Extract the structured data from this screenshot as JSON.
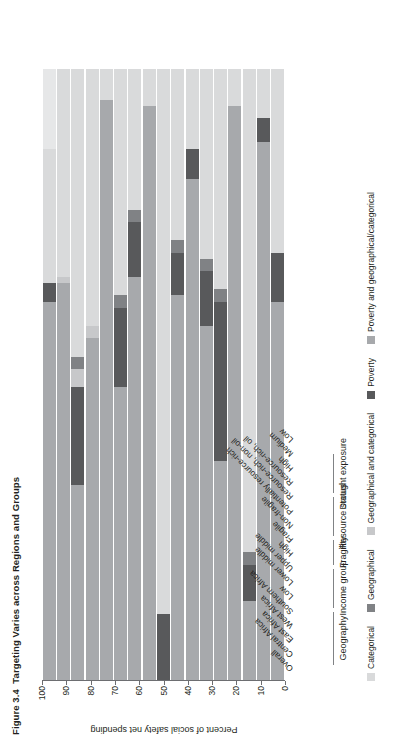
{
  "figure": {
    "number": "Figure 3.4",
    "title": "Targeting Varies across Regions and Groups"
  },
  "axis": {
    "title": "Percent of social safety net spending",
    "ticks": [
      "0",
      "10",
      "20",
      "30",
      "40",
      "50",
      "60",
      "70",
      "80",
      "90",
      "100"
    ],
    "min": 0,
    "max": 100
  },
  "legend": {
    "items": [
      {
        "label": "Categorical",
        "color": "#d9dadb"
      },
      {
        "label": "Geographical",
        "color": "#808285"
      },
      {
        "label": "Geographical and categorical",
        "color": "#c7c8ca"
      },
      {
        "label": "Poverty",
        "color": "#58595b"
      },
      {
        "label": "Poverty and geographical/categorical",
        "color": "#a7a9ac"
      }
    ]
  },
  "groups": [
    {
      "name": "Geography",
      "start": 1,
      "end": 4
    },
    {
      "name": "Income group",
      "start": 5,
      "end": 7
    },
    {
      "name": "Fragility",
      "start": 8,
      "end": 9
    },
    {
      "name": "Resource status",
      "start": 10,
      "end": 12
    },
    {
      "name": "Drought exposure",
      "start": 13,
      "end": 15
    }
  ],
  "chart_data": {
    "type": "bar",
    "orientation": "vertical-stacked",
    "title": "Targeting Varies across Regions and Groups",
    "xlabel": "",
    "ylabel": "Percent of social safety net spending",
    "ylim": [
      0,
      100
    ],
    "grid": false,
    "legend_position": "bottom",
    "series": [
      {
        "name": "Categorical",
        "color": "#d9dadb",
        "values": [
          22,
          19,
          35,
          32,
          47,
          46,
          11,
          89,
          24,
          48,
          31,
          5,
          85,
          58,
          1,
          23,
          23
        ]
      },
      {
        "name": "Geographical",
        "color": "#808285",
        "values": [
          0,
          0,
          0,
          0,
          0,
          0,
          0,
          0,
          0,
          0,
          0,
          0,
          0,
          0,
          0,
          0,
          0
        ]
      },
      {
        "name": "Geographical and categorical",
        "color": "#c7c8ca",
        "values": [
          0,
          0,
          0,
          0,
          0,
          0,
          0,
          0,
          0,
          0,
          0,
          0,
          0,
          0,
          0,
          0,
          0
        ]
      },
      {
        "name": "Poverty",
        "color": "#58595b",
        "values": [
          0,
          0,
          0,
          0,
          0,
          0,
          0,
          0,
          0,
          0,
          0,
          0,
          0,
          0,
          0,
          0,
          0
        ]
      },
      {
        "name": "Poverty and geographical/categorical",
        "color": "#a7a9ac",
        "values": [
          0,
          0,
          0,
          0,
          0,
          0,
          0,
          0,
          0,
          0,
          0,
          0,
          0,
          0,
          0,
          0,
          0
        ]
      }
    ],
    "categories": [
      "Overall",
      "Central Africa",
      "East Africa",
      "West Africa",
      "Southern Africa",
      "Low",
      "Lower middle",
      "Upper middle",
      "High",
      "Fragile",
      "Non-fragile",
      "Potentially resource-rich",
      "Resource-rich, non-oil",
      "Resource-rich, oil",
      "High",
      "Medium",
      "Low"
    ],
    "bars": [
      {
        "category": "Overall",
        "group": "",
        "segments": [
          {
            "series": "Poverty and geographical/categorical",
            "value": 62,
            "color": "#a7a9ac"
          },
          {
            "series": "Poverty",
            "value": 3,
            "color": "#58595b"
          },
          {
            "series": "Categorical",
            "value": 22,
            "color": "#d9dadb"
          },
          {
            "series": "Geographical",
            "value": 13,
            "color": "#e6e7e8"
          }
        ]
      },
      {
        "category": "Central Africa",
        "group": "Geography",
        "segments": [
          {
            "series": "Poverty and geographical/categorical",
            "value": 65,
            "color": "#a7a9ac"
          },
          {
            "series": "Geographical",
            "value": 1,
            "color": "#c7c8ca"
          },
          {
            "series": "Categorical",
            "value": 34,
            "color": "#d9dadb"
          }
        ]
      },
      {
        "category": "East Africa",
        "group": "Geography",
        "segments": [
          {
            "series": "Poverty and geographical/categorical",
            "value": 32,
            "color": "#a7a9ac"
          },
          {
            "series": "Poverty",
            "value": 16,
            "color": "#58595b"
          },
          {
            "series": "Geographical and categorical",
            "value": 3,
            "color": "#c7c8ca"
          },
          {
            "series": "Geographical",
            "value": 2,
            "color": "#808285"
          },
          {
            "series": "Categorical",
            "value": 47,
            "color": "#d9dadb"
          }
        ]
      },
      {
        "category": "West Africa",
        "group": "Geography",
        "segments": [
          {
            "series": "Poverty and geographical/categorical",
            "value": 56,
            "color": "#a7a9ac"
          },
          {
            "series": "Geographical",
            "value": 2,
            "color": "#c7c8ca"
          },
          {
            "series": "Categorical",
            "value": 42,
            "color": "#d9dadb"
          }
        ]
      },
      {
        "category": "Southern Africa",
        "group": "Geography",
        "segments": [
          {
            "series": "Poverty and geographical/categorical",
            "value": 95,
            "color": "#a7a9ac"
          },
          {
            "series": "Categorical",
            "value": 5,
            "color": "#d9dadb"
          }
        ]
      },
      {
        "category": "Low",
        "group": "Income group",
        "segments": [
          {
            "series": "Poverty and geographical/categorical",
            "value": 48,
            "color": "#a7a9ac"
          },
          {
            "series": "Poverty",
            "value": 13,
            "color": "#58595b"
          },
          {
            "series": "Geographical",
            "value": 2,
            "color": "#808285"
          },
          {
            "series": "Categorical",
            "value": 37,
            "color": "#d9dadb"
          }
        ]
      },
      {
        "category": "Lower middle",
        "group": "Income group",
        "segments": [
          {
            "series": "Poverty and geographical/categorical",
            "value": 66,
            "color": "#a7a9ac"
          },
          {
            "series": "Poverty",
            "value": 9,
            "color": "#58595b"
          },
          {
            "series": "Geographical",
            "value": 2,
            "color": "#808285"
          },
          {
            "series": "Categorical",
            "value": 23,
            "color": "#d9dadb"
          }
        ]
      },
      {
        "category": "Upper middle",
        "group": "Income group",
        "segments": [
          {
            "series": "Poverty and geographical/categorical",
            "value": 94,
            "color": "#a7a9ac"
          },
          {
            "series": "Categorical",
            "value": 6,
            "color": "#d9dadb"
          }
        ]
      },
      {
        "category": "High",
        "group": "Income group",
        "segments": [
          {
            "series": "Poverty",
            "value": 11,
            "color": "#58595b"
          },
          {
            "series": "Categorical",
            "value": 89,
            "color": "#d9dadb"
          }
        ]
      },
      {
        "category": "Fragile",
        "group": "Fragility",
        "segments": [
          {
            "series": "Poverty and geographical/categorical",
            "value": 63,
            "color": "#a7a9ac"
          },
          {
            "series": "Poverty",
            "value": 7,
            "color": "#58595b"
          },
          {
            "series": "Geographical",
            "value": 2,
            "color": "#808285"
          },
          {
            "series": "Categorical",
            "value": 28,
            "color": "#d9dadb"
          }
        ]
      },
      {
        "category": "Non-fragile",
        "group": "Fragility",
        "segments": [
          {
            "series": "Poverty and geographical/categorical",
            "value": 82,
            "color": "#a7a9ac"
          },
          {
            "series": "Poverty",
            "value": 5,
            "color": "#58595b"
          },
          {
            "series": "Categorical",
            "value": 13,
            "color": "#d9dadb"
          }
        ]
      },
      {
        "category": "Potentially resource-rich",
        "group": "Resource status",
        "segments": [
          {
            "series": "Poverty and geographical/categorical",
            "value": 58,
            "color": "#a7a9ac"
          },
          {
            "series": "Poverty",
            "value": 9,
            "color": "#58595b"
          },
          {
            "series": "Geographical",
            "value": 2,
            "color": "#808285"
          },
          {
            "series": "Categorical",
            "value": 31,
            "color": "#d9dadb"
          }
        ]
      },
      {
        "category": "Resource-rich, non-oil",
        "group": "Resource status",
        "segments": [
          {
            "series": "Poverty and geographical/categorical",
            "value": 36,
            "color": "#a7a9ac"
          },
          {
            "series": "Poverty",
            "value": 26,
            "color": "#58595b"
          },
          {
            "series": "Geographical",
            "value": 2,
            "color": "#808285"
          },
          {
            "series": "Categorical",
            "value": 36,
            "color": "#d9dadb"
          }
        ]
      },
      {
        "category": "Resource-rich, oil",
        "group": "Resource status",
        "segments": [
          {
            "series": "Poverty and geographical/categorical",
            "value": 94,
            "color": "#a7a9ac"
          },
          {
            "series": "Categorical",
            "value": 6,
            "color": "#d9dadb"
          }
        ]
      },
      {
        "category": "High",
        "group": "Drought exposure",
        "segments": [
          {
            "series": "Poverty and geographical/categorical",
            "value": 13,
            "color": "#a7a9ac"
          },
          {
            "series": "Poverty",
            "value": 6,
            "color": "#58595b"
          },
          {
            "series": "Geographical",
            "value": 2,
            "color": "#808285"
          },
          {
            "series": "Categorical",
            "value": 79,
            "color": "#d9dadb"
          }
        ]
      },
      {
        "category": "Medium",
        "group": "Drought exposure",
        "segments": [
          {
            "series": "Poverty and geographical/categorical",
            "value": 88,
            "color": "#a7a9ac"
          },
          {
            "series": "Poverty",
            "value": 4,
            "color": "#58595b"
          },
          {
            "series": "Categorical",
            "value": 8,
            "color": "#d9dadb"
          }
        ]
      },
      {
        "category": "Low",
        "group": "Drought exposure",
        "segments": [
          {
            "series": "Poverty and geographical/categorical",
            "value": 62,
            "color": "#a7a9ac"
          },
          {
            "series": "Poverty",
            "value": 8,
            "color": "#58595b"
          },
          {
            "series": "Categorical",
            "value": 30,
            "color": "#d9dadb"
          }
        ]
      }
    ]
  }
}
